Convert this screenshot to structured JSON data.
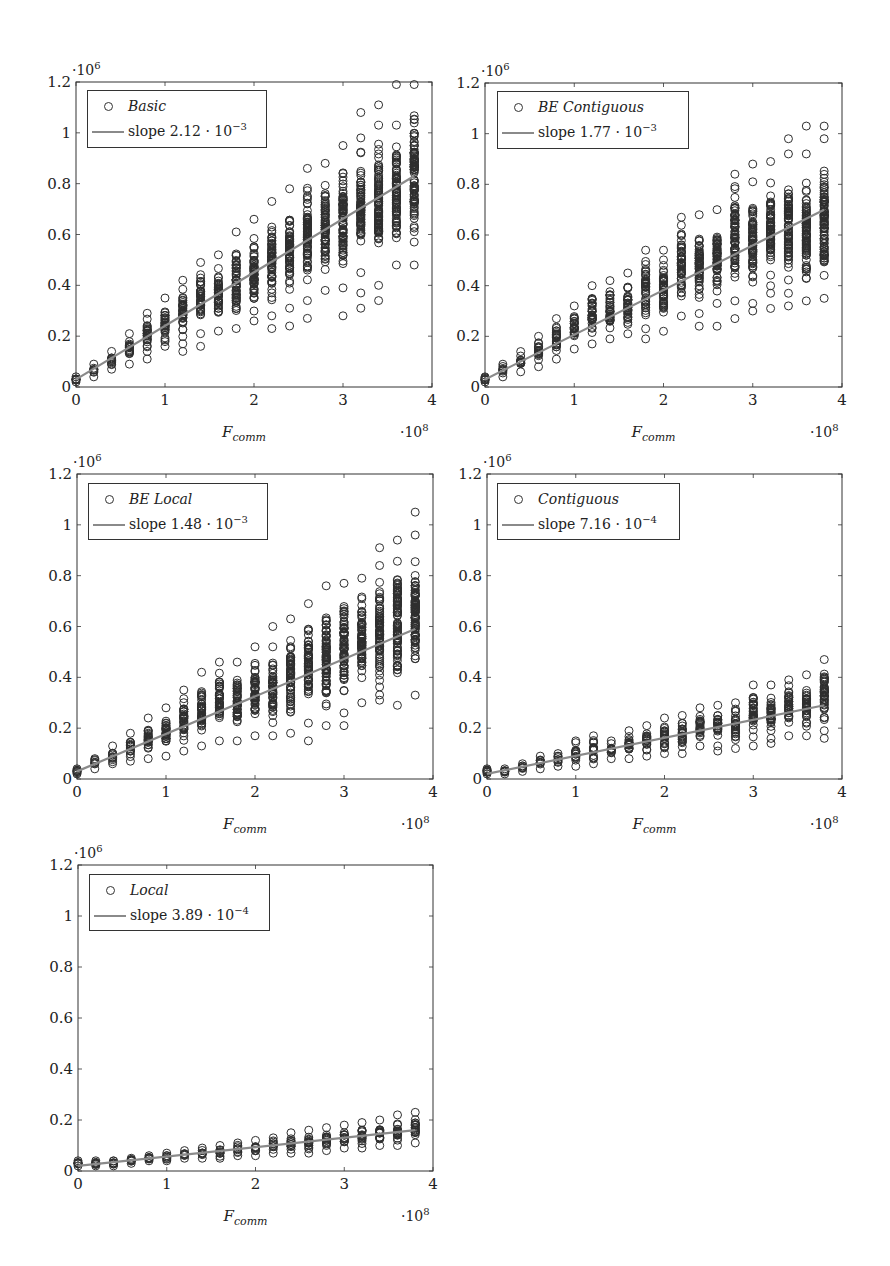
{
  "figure": {
    "panels": [
      {
        "id": "basic",
        "legend_series": "Basic",
        "legend_fit": "slope 2.12 · 10",
        "legend_fit_exp": "−3"
      },
      {
        "id": "be-contiguous",
        "legend_series": "BE Contiguous",
        "legend_fit": "slope 1.77 · 10",
        "legend_fit_exp": "−3"
      },
      {
        "id": "be-local",
        "legend_series": "BE Local",
        "legend_fit": "slope 1.48 · 10",
        "legend_fit_exp": "−3"
      },
      {
        "id": "contiguous",
        "legend_series": "Contiguous",
        "legend_fit": "slope 7.16 · 10",
        "legend_fit_exp": "−4"
      },
      {
        "id": "local",
        "legend_series": "Local",
        "legend_fit": "slope 3.89 · 10",
        "legend_fit_exp": "−4"
      }
    ]
  },
  "colors": {
    "marker": "#2e2e2e",
    "fit_line": "#8a8a8a",
    "axis": "#333333",
    "legend_border": "#333333"
  },
  "chart_data": [
    {
      "type": "scatter",
      "title": "",
      "xlabel": "F_comm",
      "xlabel_main": "F",
      "xlabel_sub": "comm",
      "ylabel": "",
      "x_multiplier": "·10^8",
      "y_multiplier": "·10^6",
      "xlim": [
        0,
        4
      ],
      "ylim": [
        0,
        1.2
      ],
      "xticks": [
        0,
        1,
        2,
        3,
        4
      ],
      "yticks": [
        0,
        0.2,
        0.4,
        0.6,
        0.8,
        1,
        1.2
      ],
      "ytick_labels": [
        "0",
        "0.2",
        "0.4",
        "0.6",
        "0.8",
        "1",
        "1.2"
      ],
      "grid": false,
      "legend_position": "upper left",
      "legend": [
        "Basic",
        "slope 2.12 · 10^-3"
      ],
      "series": [
        {
          "name": "Basic",
          "kind": "scatter",
          "x": [
            0,
            0.2,
            0.4,
            0.6,
            0.8,
            1.0,
            1.2,
            1.4,
            1.6,
            1.8,
            2.0,
            2.2,
            2.4,
            2.6,
            2.8,
            3.0,
            3.2,
            3.4,
            3.6,
            3.8
          ],
          "y_min": [
            0.02,
            0.04,
            0.07,
            0.09,
            0.11,
            0.16,
            0.17,
            0.21,
            0.22,
            0.23,
            0.26,
            0.28,
            0.31,
            0.34,
            0.38,
            0.39,
            0.45,
            0.4,
            0.48,
            0.48
          ],
          "y_max": [
            0.04,
            0.09,
            0.14,
            0.21,
            0.29,
            0.35,
            0.42,
            0.49,
            0.52,
            0.61,
            0.66,
            0.73,
            0.78,
            0.86,
            0.88,
            0.95,
            0.98,
            1.03,
            1.03,
            1.19
          ],
          "outliers": [
            [
              1.2,
              0.14
            ],
            [
              1.4,
              0.16
            ],
            [
              2.2,
              0.23
            ],
            [
              2.4,
              0.24
            ],
            [
              2.6,
              0.27
            ],
            [
              3.0,
              0.28
            ],
            [
              3.2,
              0.31
            ],
            [
              3.2,
              0.37
            ],
            [
              3.2,
              1.08
            ],
            [
              3.4,
              0.34
            ],
            [
              3.4,
              1.11
            ],
            [
              3.6,
              1.19
            ]
          ]
        },
        {
          "name": "slope 2.12 · 10^-3",
          "kind": "line",
          "x": [
            0,
            3.8
          ],
          "y": [
            0.03,
            0.83
          ]
        }
      ]
    },
    {
      "type": "scatter",
      "xlabel": "F_comm",
      "x_multiplier": "·10^8",
      "y_multiplier": "·10^6",
      "xlim": [
        0,
        4
      ],
      "ylim": [
        0,
        1.2
      ],
      "xticks": [
        0,
        1,
        2,
        3,
        4
      ],
      "yticks": [
        0,
        0.2,
        0.4,
        0.6,
        0.8,
        1,
        1.2
      ],
      "legend": [
        "BE Contiguous",
        "slope 1.77 · 10^-3"
      ],
      "series": [
        {
          "name": "BE Contiguous",
          "kind": "scatter",
          "x": [
            0,
            0.2,
            0.4,
            0.6,
            0.8,
            1.0,
            1.2,
            1.4,
            1.6,
            1.8,
            2.0,
            2.2,
            2.4,
            2.6,
            2.8,
            3.0,
            3.2,
            3.4,
            3.6,
            3.8
          ],
          "y_min": [
            0.02,
            0.04,
            0.06,
            0.08,
            0.11,
            0.15,
            0.17,
            0.19,
            0.21,
            0.23,
            0.22,
            0.28,
            0.29,
            0.33,
            0.34,
            0.33,
            0.37,
            0.37,
            0.34,
            0.35
          ],
          "y_max": [
            0.04,
            0.09,
            0.14,
            0.2,
            0.27,
            0.32,
            0.4,
            0.42,
            0.45,
            0.54,
            0.54,
            0.67,
            0.68,
            0.7,
            0.84,
            0.81,
            0.89,
            0.92,
            0.92,
            0.98
          ],
          "outliers": [
            [
              1.8,
              0.19
            ],
            [
              2.4,
              0.24
            ],
            [
              2.6,
              0.24
            ],
            [
              2.8,
              0.27
            ],
            [
              3.0,
              0.3
            ],
            [
              3.0,
              0.88
            ],
            [
              3.2,
              0.31
            ],
            [
              3.4,
              0.32
            ],
            [
              3.4,
              0.98
            ],
            [
              3.6,
              1.03
            ],
            [
              3.8,
              1.03
            ]
          ]
        },
        {
          "name": "slope 1.77 · 10^-3",
          "kind": "line",
          "x": [
            0,
            3.8
          ],
          "y": [
            0.03,
            0.7
          ]
        }
      ]
    },
    {
      "type": "scatter",
      "xlabel": "F_comm",
      "x_multiplier": "·10^8",
      "y_multiplier": "·10^6",
      "xlim": [
        0,
        4
      ],
      "ylim": [
        0,
        1.2
      ],
      "xticks": [
        0,
        1,
        2,
        3,
        4
      ],
      "yticks": [
        0,
        0.2,
        0.4,
        0.6,
        0.8,
        1,
        1.2
      ],
      "legend": [
        "BE Local",
        "slope 1.48 · 10^-3"
      ],
      "series": [
        {
          "name": "BE Local",
          "kind": "scatter",
          "x": [
            0,
            0.2,
            0.4,
            0.6,
            0.8,
            1.0,
            1.2,
            1.4,
            1.6,
            1.8,
            2.0,
            2.2,
            2.4,
            2.6,
            2.8,
            3.0,
            3.2,
            3.4,
            3.6,
            3.8
          ],
          "y_min": [
            0.02,
            0.04,
            0.06,
            0.07,
            0.08,
            0.09,
            0.11,
            0.13,
            0.15,
            0.15,
            0.17,
            0.17,
            0.18,
            0.22,
            0.21,
            0.26,
            0.3,
            0.31,
            0.29,
            0.33
          ],
          "y_max": [
            0.04,
            0.08,
            0.13,
            0.18,
            0.24,
            0.28,
            0.35,
            0.42,
            0.46,
            0.46,
            0.52,
            0.52,
            0.63,
            0.69,
            0.76,
            0.77,
            0.79,
            0.84,
            0.94,
            0.96
          ],
          "outliers": [
            [
              2.2,
              0.6
            ],
            [
              2.6,
              0.15
            ],
            [
              3.0,
              0.21
            ],
            [
              3.4,
              0.91
            ],
            [
              3.8,
              1.05
            ]
          ]
        },
        {
          "name": "slope 1.48 · 10^-3",
          "kind": "line",
          "x": [
            0,
            3.8
          ],
          "y": [
            0.03,
            0.59
          ]
        }
      ]
    },
    {
      "type": "scatter",
      "xlabel": "F_comm",
      "x_multiplier": "·10^8",
      "y_multiplier": "·10^6",
      "xlim": [
        0,
        4
      ],
      "ylim": [
        0,
        1.2
      ],
      "xticks": [
        0,
        1,
        2,
        3,
        4
      ],
      "yticks": [
        0,
        0.2,
        0.4,
        0.6,
        0.8,
        1,
        1.2
      ],
      "legend": [
        "Contiguous",
        "slope 7.16 · 10^-4"
      ],
      "series": [
        {
          "name": "Contiguous",
          "kind": "scatter",
          "x": [
            0,
            0.2,
            0.4,
            0.6,
            0.8,
            1.0,
            1.2,
            1.4,
            1.6,
            1.8,
            2.0,
            2.2,
            2.4,
            2.6,
            2.8,
            3.0,
            3.2,
            3.4,
            3.6,
            3.8
          ],
          "y_min": [
            0.02,
            0.02,
            0.03,
            0.04,
            0.05,
            0.05,
            0.06,
            0.08,
            0.08,
            0.09,
            0.1,
            0.1,
            0.13,
            0.13,
            0.12,
            0.13,
            0.14,
            0.17,
            0.17,
            0.19
          ],
          "y_max": [
            0.04,
            0.04,
            0.06,
            0.09,
            0.1,
            0.15,
            0.17,
            0.15,
            0.19,
            0.21,
            0.24,
            0.25,
            0.28,
            0.29,
            0.3,
            0.37,
            0.37,
            0.39,
            0.41,
            0.47
          ],
          "outliers": [
            [
              2.6,
              0.11
            ],
            [
              3.8,
              0.16
            ]
          ]
        },
        {
          "name": "slope 7.16 · 10^-4",
          "kind": "line",
          "x": [
            0,
            3.8
          ],
          "y": [
            0.02,
            0.29
          ]
        }
      ]
    },
    {
      "type": "scatter",
      "xlabel": "F_comm",
      "x_multiplier": "·10^8",
      "y_multiplier": "·10^6",
      "xlim": [
        0,
        4
      ],
      "ylim": [
        0,
        1.2
      ],
      "xticks": [
        0,
        1,
        2,
        3,
        4
      ],
      "yticks": [
        0,
        0.2,
        0.4,
        0.6,
        0.8,
        1,
        1.2
      ],
      "legend": [
        "Local",
        "slope 3.89 · 10^-4"
      ],
      "series": [
        {
          "name": "Local",
          "kind": "scatter",
          "x": [
            0,
            0.2,
            0.4,
            0.6,
            0.8,
            1.0,
            1.2,
            1.4,
            1.6,
            1.8,
            2.0,
            2.2,
            2.4,
            2.6,
            2.8,
            3.0,
            3.2,
            3.4,
            3.6,
            3.8
          ],
          "y_min": [
            0.02,
            0.02,
            0.02,
            0.03,
            0.04,
            0.04,
            0.05,
            0.05,
            0.05,
            0.06,
            0.06,
            0.07,
            0.07,
            0.07,
            0.08,
            0.09,
            0.09,
            0.1,
            0.1,
            0.11
          ],
          "y_max": [
            0.04,
            0.04,
            0.04,
            0.05,
            0.06,
            0.07,
            0.08,
            0.09,
            0.1,
            0.11,
            0.12,
            0.13,
            0.15,
            0.16,
            0.17,
            0.18,
            0.19,
            0.2,
            0.22,
            0.23
          ],
          "outliers": []
        },
        {
          "name": "slope 3.89 · 10^-4",
          "kind": "line",
          "x": [
            0,
            3.8
          ],
          "y": [
            0.02,
            0.16
          ]
        }
      ]
    }
  ]
}
